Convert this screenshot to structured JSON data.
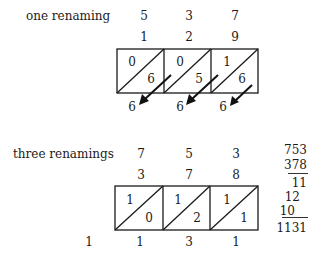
{
  "sections": [
    {
      "label": "one renaming",
      "top_digits": [
        "5",
        "3",
        "7"
      ],
      "second_digits": [
        "1",
        "2",
        "9"
      ],
      "cells": [
        {
          "upper": "0",
          "lower": "6"
        },
        {
          "upper": "0",
          "lower": "5"
        },
        {
          "upper": "1",
          "lower": "6"
        }
      ],
      "result_digits": [
        "6",
        "6",
        "6"
      ],
      "arrows": true
    },
    {
      "label": "three renamings",
      "top_digits": [
        "7",
        "5",
        "3"
      ],
      "second_digits": [
        "3",
        "7",
        "8"
      ],
      "cells": [
        {
          "upper": "1",
          "lower": "0"
        },
        {
          "upper": "1",
          "lower": "2"
        },
        {
          "upper": "1",
          "lower": "1"
        }
      ],
      "carry_digit": "1",
      "result_digits": [
        "1",
        "3",
        "1"
      ],
      "arrows": false
    }
  ],
  "side_calculation": {
    "addend1": "753",
    "addend2": "378",
    "partials": [
      "11",
      "12",
      "10"
    ],
    "total": "1131"
  }
}
